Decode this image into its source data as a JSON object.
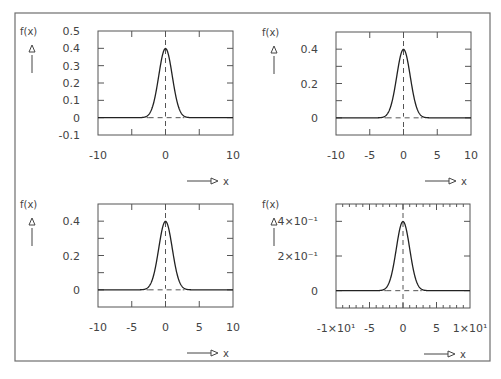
{
  "figure": {
    "frame": {
      "x": 15,
      "y": 13,
      "w": 475,
      "h": 348
    },
    "colors": {
      "frame": "#6e6e6e",
      "axes": "#555555",
      "curve": "#222222",
      "dash": "#555555",
      "text": "#444444"
    },
    "ylabel_text": "f(x)",
    "xlabel_text": "x"
  },
  "chart_data": [
    {
      "type": "line",
      "title": "",
      "xlabel": "x",
      "ylabel": "f(x)",
      "xlim": [
        -10,
        10
      ],
      "ylim": [
        -0.1,
        0.5
      ],
      "grid": false,
      "legend": null,
      "box": {
        "x0": 98,
        "y0": 31,
        "x1": 233,
        "y1": 135
      },
      "xticks": [
        -10,
        -5,
        0,
        5,
        10
      ],
      "xtick_labels": [
        "-10",
        "",
        "0",
        "",
        "10"
      ],
      "yticks": [
        -0.1,
        0,
        0.1,
        0.2,
        0.3,
        0.4,
        0.5
      ],
      "ytick_labels": [
        "-0.1",
        "0",
        "0.1",
        "0.2",
        "0.3",
        "0.4",
        "0.5"
      ],
      "minor_xticks": [],
      "series": [
        {
          "name": "standard normal pdf",
          "function": "exp(-x^2/2)/sqrt(2*pi)",
          "mean": 0,
          "sd": 1,
          "peak": 0.399
        }
      ],
      "annotations": [
        "dashed vertical line at x=0",
        "dashed horizontal line at y=0"
      ]
    },
    {
      "type": "line",
      "title": "",
      "xlabel": "x",
      "ylabel": "f(x)",
      "xlim": [
        -10,
        10
      ],
      "ylim": [
        -0.1,
        0.5
      ],
      "grid": false,
      "legend": null,
      "box": {
        "x0": 336,
        "y0": 32,
        "x1": 471,
        "y1": 135
      },
      "xticks": [
        -10,
        -5,
        0,
        5,
        10
      ],
      "xtick_labels": [
        "-10",
        "-5",
        "0",
        "5",
        "10"
      ],
      "yticks": [
        0,
        0.1,
        0.2,
        0.3,
        0.4
      ],
      "ytick_labels": [
        "0",
        "",
        "0.2",
        "",
        "0.4"
      ],
      "minor_xticks": [],
      "series": [
        {
          "name": "standard normal pdf",
          "function": "exp(-x^2/2)/sqrt(2*pi)",
          "mean": 0,
          "sd": 1,
          "peak": 0.399
        }
      ],
      "annotations": [
        "dashed vertical line at x=0",
        "dashed horizontal line at y=0"
      ]
    },
    {
      "type": "line",
      "title": "",
      "xlabel": "x",
      "ylabel": "f(x)",
      "xlim": [
        -10,
        10
      ],
      "ylim": [
        -0.1,
        0.5
      ],
      "grid": false,
      "legend": null,
      "box": {
        "x0": 98,
        "y0": 204,
        "x1": 233,
        "y1": 307
      },
      "xticks": [
        -10,
        -5,
        0,
        5,
        10
      ],
      "xtick_labels": [
        "-10",
        "-5",
        "0",
        "5",
        "10"
      ],
      "yticks": [
        0,
        0.1,
        0.2,
        0.3,
        0.4
      ],
      "ytick_labels": [
        "0",
        "",
        "0.2",
        "",
        "0.4"
      ],
      "minor_xticks": [],
      "series": [
        {
          "name": "standard normal pdf",
          "function": "exp(-x^2/2)/sqrt(2*pi)",
          "mean": 0,
          "sd": 1,
          "peak": 0.399
        }
      ],
      "annotations": [
        "dashed vertical line at x=0",
        "dashed horizontal line at y=0"
      ]
    },
    {
      "type": "line",
      "title": "",
      "xlabel": "x",
      "ylabel": "f(x)",
      "xlim": [
        -10,
        10
      ],
      "ylim": [
        -0.1,
        0.5
      ],
      "grid": false,
      "legend": null,
      "box": {
        "x0": 336,
        "y0": 204,
        "x1": 470,
        "y1": 308
      },
      "xticks": [
        -10,
        -5,
        0,
        5,
        10
      ],
      "xtick_labels": [
        "-1×10¹",
        "-5",
        "0",
        "5",
        "1×10¹"
      ],
      "yticks": [
        0,
        0.2,
        0.4
      ],
      "ytick_labels": [
        "0",
        "2×10⁻¹",
        "4×10⁻¹"
      ],
      "minor_xticks": [
        -9,
        -8,
        -7,
        -6,
        -4,
        -3,
        -2,
        -1,
        1,
        2,
        3,
        4,
        6,
        7,
        8,
        9
      ],
      "series": [
        {
          "name": "standard normal pdf",
          "function": "exp(-x^2/2)/sqrt(2*pi)",
          "mean": 0,
          "sd": 1,
          "peak": 0.399
        }
      ],
      "annotations": [
        "dashed vertical line at x=0",
        "dashed horizontal line at y=0"
      ]
    }
  ]
}
